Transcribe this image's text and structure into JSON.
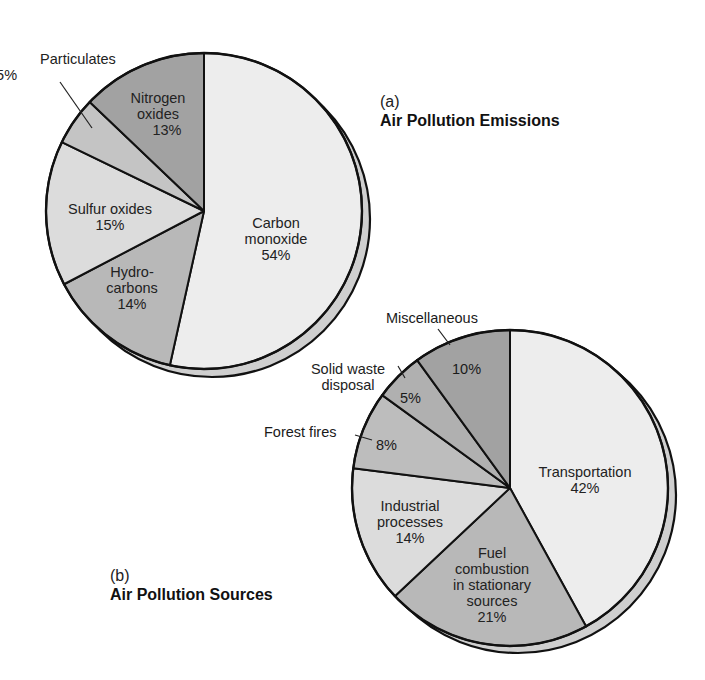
{
  "chart_data": [
    {
      "type": "pie",
      "panel": "(a)",
      "title": "Air Pollution Emissions",
      "start_angle": "12 o'clock, clockwise",
      "slices": [
        {
          "label": "Carbon monoxide",
          "value": 54,
          "display": "54%",
          "shade": "#ededed"
        },
        {
          "label": "Hydrocarbons",
          "value": 14,
          "display": "14%",
          "shade": "#b8b8b8"
        },
        {
          "label": "Sulfur oxides",
          "value": 15,
          "display": "15%",
          "shade": "#dcdcdc"
        },
        {
          "label": "Particulates",
          "value": 5,
          "display": "5%",
          "shade": "#c4c4c4"
        },
        {
          "label": "Nitrogen oxides",
          "value": 13,
          "display": "13%",
          "shade": "#a2a2a2"
        }
      ]
    },
    {
      "type": "pie",
      "panel": "(b)",
      "title": "Air Pollution Sources",
      "start_angle": "12 o'clock, clockwise",
      "slices": [
        {
          "label": "Transportation",
          "value": 42,
          "display": "42%",
          "shade": "#ededed"
        },
        {
          "label": "Fuel combustion in stationary sources",
          "value": 21,
          "display": "21%",
          "shade": "#b8b8b8"
        },
        {
          "label": "Industrial processes",
          "value": 14,
          "display": "14%",
          "shade": "#dcdcdc"
        },
        {
          "label": "Forest fires",
          "value": 8,
          "display": "8%",
          "shade": "#bdbdbd"
        },
        {
          "label": "Solid waste disposal",
          "value": 5,
          "display": "5%",
          "shade": "#b0b0b0"
        },
        {
          "label": "Miscellaneous",
          "value": 10,
          "display": "10%",
          "shade": "#a2a2a2"
        }
      ]
    }
  ],
  "panel_a": {
    "letter": "(a)",
    "title": "Air Pollution Emissions",
    "labels": {
      "carbon_monoxide": [
        "Carbon",
        "monoxide",
        "54%"
      ],
      "hydrocarbons": [
        "Hydro-",
        "carbons",
        "14%"
      ],
      "sulfur_oxides": [
        "Sulfur oxides",
        "15%"
      ],
      "particulates": [
        "Particulates",
        "5%"
      ],
      "nitrogen_oxides": [
        "Nitrogen",
        "oxides",
        "13%"
      ]
    }
  },
  "panel_b": {
    "letter": "(b)",
    "title": "Air Pollution Sources",
    "labels": {
      "transportation": [
        "Transportation",
        "42%"
      ],
      "fuel_combustion": [
        "Fuel",
        "combustion",
        "in stationary",
        "sources",
        "21%"
      ],
      "industrial": [
        "Industrial",
        "processes",
        "14%"
      ],
      "forest_fires_name": "Forest fires",
      "forest_fires_pct": "8%",
      "solid_waste_name": [
        "Solid waste",
        "disposal"
      ],
      "solid_waste_pct": "5%",
      "misc_name": "Miscellaneous",
      "misc_pct": "10%"
    }
  },
  "colors": {
    "outline": "#111111",
    "shadow": "#cfcfcf",
    "background": "#ffffff"
  }
}
